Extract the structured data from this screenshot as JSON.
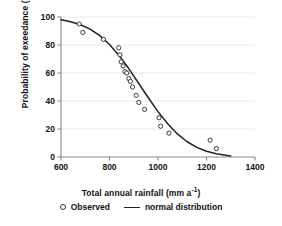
{
  "chart_data": {
    "type": "scatter",
    "title": "",
    "xlabel": "Total annual rainfall (mm a-1)",
    "ylabel": "Probability of exeedance (%)",
    "xlim": [
      600,
      1400
    ],
    "ylim": [
      0,
      100
    ],
    "xticks": [
      600,
      800,
      1000,
      1200,
      1400
    ],
    "yticks": [
      0,
      20,
      40,
      60,
      80,
      100
    ],
    "grid": "horizontal",
    "legend_position": "bottom",
    "series": [
      {
        "name": "Observed",
        "marker": "open-circle",
        "x": [
          675,
          690,
          775,
          838,
          843,
          848,
          856,
          864,
          871,
          880,
          886,
          895,
          910,
          921,
          945,
          1004,
          1011,
          1045,
          1215,
          1241
        ],
        "y": [
          95,
          89,
          84,
          78,
          73,
          68,
          65,
          61,
          60,
          56,
          54,
          50,
          44,
          39,
          34,
          28,
          22,
          17,
          12,
          6
        ]
      },
      {
        "name": "normal distribution",
        "marker": "line",
        "x": [
          600,
          640,
          680,
          720,
          760,
          800,
          840,
          880,
          920,
          960,
          1000,
          1040,
          1080,
          1120,
          1160,
          1200,
          1240,
          1280,
          1300
        ],
        "y": [
          98.0,
          96.6,
          94.5,
          91.3,
          86.7,
          80.4,
          72.4,
          63.0,
          52.7,
          42.3,
          32.4,
          23.7,
          16.5,
          10.9,
          6.9,
          4.1,
          2.3,
          1.2,
          0.8
        ]
      }
    ]
  },
  "axis": {
    "x_title_main": "Total annual rainfall (mm a",
    "x_title_sup": "-1",
    "x_title_end": ")",
    "y_title": "Probability of exeedance (%)"
  },
  "legend": {
    "observed_label": "Observed",
    "normal_label": "normal distribution"
  },
  "colors": {
    "curve": "#222222",
    "marker_stroke": "#3a3a3a",
    "axis": "#8a8a8a",
    "grid": "#e8e8e8",
    "text": "#111111",
    "background": "#ffffff"
  }
}
